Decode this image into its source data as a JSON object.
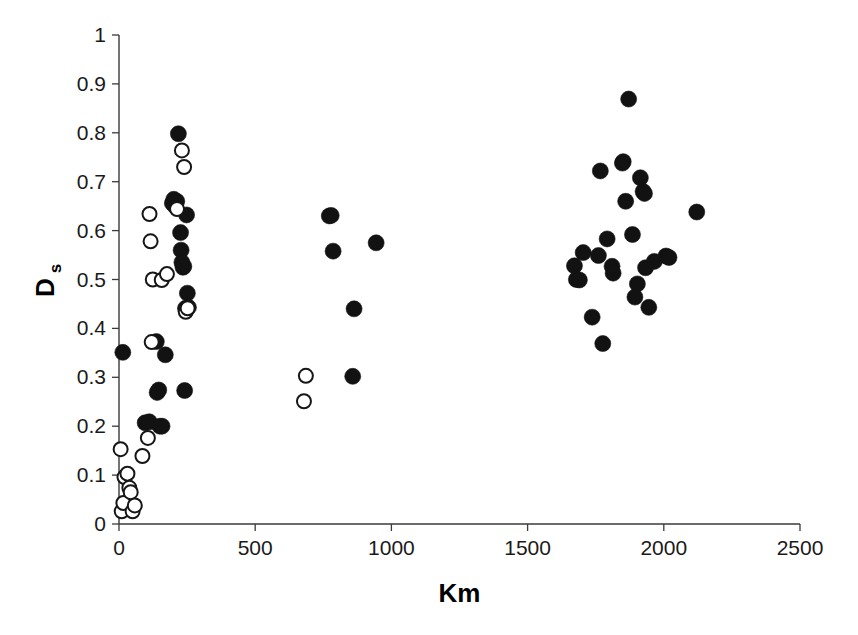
{
  "chart_data": {
    "type": "scatter",
    "title": "",
    "xlabel": "Km",
    "ylabel": "Ds",
    "ylabel_base": "D",
    "ylabel_subscript": "s",
    "xlim": [
      0,
      2500
    ],
    "ylim": [
      0,
      1
    ],
    "xticks": [
      0,
      500,
      1000,
      1500,
      2000,
      2500
    ],
    "xtick_labels": [
      "0",
      "500",
      "1000",
      "1500",
      "2000",
      "2500"
    ],
    "yticks": [
      0,
      0.1,
      0.2,
      0.3,
      0.4,
      0.5,
      0.6,
      0.7,
      0.8,
      0.9,
      1
    ],
    "ytick_labels": [
      "0",
      "0.1",
      "0.2",
      "0.3",
      "0.4",
      "0.5",
      "0.6",
      "0.7",
      "0.8",
      "0.9",
      "1"
    ],
    "grid": false,
    "legend": false,
    "marker_colors": {
      "filled": "#121212",
      "open_fill": "#ffffff",
      "open_stroke": "#161616",
      "axis": "#3a3a3a"
    },
    "series": [
      {
        "name": "filled",
        "marker": "filled-circle",
        "points": [
          [
            14,
            0.351
          ],
          [
            96,
            0.207
          ],
          [
            111,
            0.209
          ],
          [
            137,
            0.373
          ],
          [
            140,
            0.269
          ],
          [
            146,
            0.274
          ],
          [
            150,
            0.2
          ],
          [
            158,
            0.2
          ],
          [
            170,
            0.346
          ],
          [
            196,
            0.656
          ],
          [
            201,
            0.664
          ],
          [
            206,
            0.65
          ],
          [
            212,
            0.66
          ],
          [
            218,
            0.798
          ],
          [
            226,
            0.596
          ],
          [
            228,
            0.56
          ],
          [
            231,
            0.535
          ],
          [
            235,
            0.525
          ],
          [
            238,
            0.527
          ],
          [
            241,
            0.273
          ],
          [
            244,
            0.441
          ],
          [
            248,
            0.632
          ],
          [
            251,
            0.472
          ],
          [
            255,
            0.443
          ],
          [
            772,
            0.63
          ],
          [
            779,
            0.631
          ],
          [
            786,
            0.558
          ],
          [
            858,
            0.302
          ],
          [
            863,
            0.44
          ],
          [
            944,
            0.575
          ],
          [
            1672,
            0.528
          ],
          [
            1679,
            0.5
          ],
          [
            1690,
            0.499
          ],
          [
            1704,
            0.555
          ],
          [
            1737,
            0.423
          ],
          [
            1760,
            0.549
          ],
          [
            1767,
            0.722
          ],
          [
            1776,
            0.369
          ],
          [
            1792,
            0.583
          ],
          [
            1810,
            0.527
          ],
          [
            1814,
            0.513
          ],
          [
            1848,
            0.738
          ],
          [
            1851,
            0.741
          ],
          [
            1860,
            0.66
          ],
          [
            1871,
            0.869
          ],
          [
            1885,
            0.592
          ],
          [
            1894,
            0.464
          ],
          [
            1903,
            0.491
          ],
          [
            1914,
            0.708
          ],
          [
            1924,
            0.68
          ],
          [
            1929,
            0.676
          ],
          [
            1933,
            0.524
          ],
          [
            1945,
            0.443
          ],
          [
            1965,
            0.537
          ],
          [
            2008,
            0.548
          ],
          [
            2019,
            0.545
          ],
          [
            2121,
            0.638
          ]
        ]
      },
      {
        "name": "open",
        "marker": "open-circle",
        "points": [
          [
            6,
            0.153
          ],
          [
            10,
            0.026
          ],
          [
            16,
            0.043
          ],
          [
            20,
            0.096
          ],
          [
            31,
            0.103
          ],
          [
            38,
            0.074
          ],
          [
            43,
            0.065
          ],
          [
            50,
            0.026
          ],
          [
            58,
            0.038
          ],
          [
            86,
            0.139
          ],
          [
            106,
            0.176
          ],
          [
            112,
            0.634
          ],
          [
            116,
            0.578
          ],
          [
            120,
            0.372
          ],
          [
            124,
            0.5
          ],
          [
            157,
            0.499
          ],
          [
            176,
            0.511
          ],
          [
            213,
            0.644
          ],
          [
            231,
            0.764
          ],
          [
            239,
            0.73
          ],
          [
            245,
            0.434
          ],
          [
            252,
            0.441
          ],
          [
            679,
            0.251
          ],
          [
            686,
            0.303
          ]
        ]
      }
    ]
  },
  "layout": {
    "plot_left_px": 119,
    "plot_right_px": 800,
    "plot_top_px": 35,
    "plot_bottom_px": 524
  }
}
